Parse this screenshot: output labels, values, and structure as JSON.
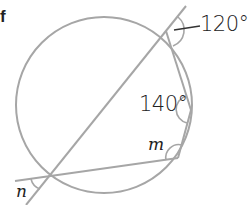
{
  "fragment_text": "f",
  "diagram": {
    "labels": {
      "angle_top_right": "120°",
      "angle_right": "140°",
      "angle_m": "m",
      "angle_n": "n"
    },
    "colors": {
      "line": "#a6a6a6",
      "text": "#222222",
      "background": "#ffffff"
    }
  }
}
